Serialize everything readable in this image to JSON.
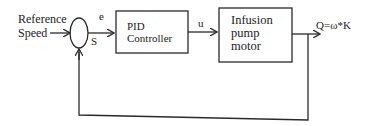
{
  "diagram": {
    "type": "closed-loop control block diagram",
    "input": {
      "label_line1": "Reference",
      "label_line2": "Speed"
    },
    "summing_junction": {
      "error_label": "e",
      "sign_label": "S"
    },
    "blocks": [
      {
        "id": "pid",
        "line1": "PID",
        "line2": "Controller"
      },
      {
        "id": "plant",
        "line1": "Infusion",
        "line2": "pump",
        "line3": "motor"
      }
    ],
    "signals": {
      "control": "u"
    },
    "output": {
      "label": "Q=ω*K"
    },
    "feedback": {
      "from": "output",
      "to": "summing_junction"
    },
    "colors": {
      "stroke": "#2a2a2a",
      "background": "#ffffff",
      "text": "#222222"
    }
  }
}
